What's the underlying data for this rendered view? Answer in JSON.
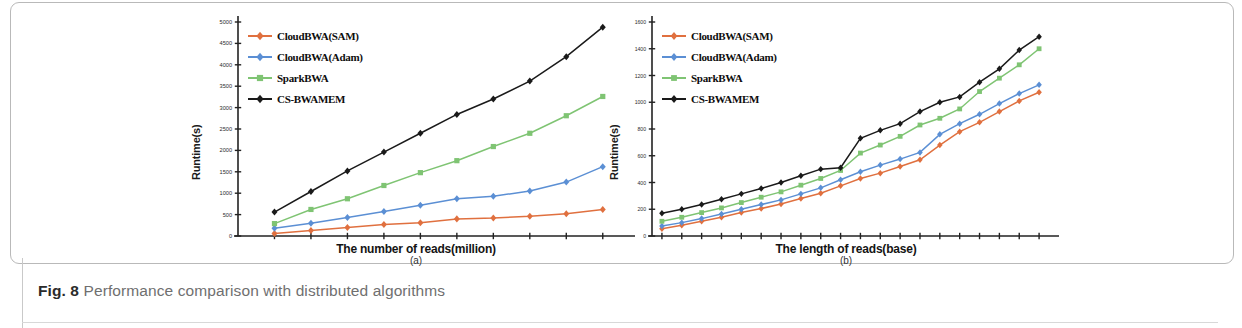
{
  "figure": {
    "number_label": "Fig. 8",
    "caption": "Performance comparison with distributed algorithms"
  },
  "colors": {
    "cloudbwa_sam": "#e0703f",
    "cloudbwa_adam": "#5b8fd4",
    "sparkbwa": "#7fc473",
    "cs_bwamem": "#1a1a1a",
    "axis": "#222222",
    "frame_border": "#b9b9b9",
    "caption_text": "#6f6f6f"
  },
  "legend": {
    "entries": [
      {
        "label": "CloudBWA(SAM)",
        "color_key": "cloudbwa_sam",
        "marker": "diamond"
      },
      {
        "label": "CloudBWA(Adam)",
        "color_key": "cloudbwa_adam",
        "marker": "diamond"
      },
      {
        "label": "SparkBWA",
        "color_key": "sparkbwa",
        "marker": "square"
      },
      {
        "label": "CS-BWAMEM",
        "color_key": "cs_bwamem",
        "marker": "diamond"
      }
    ]
  },
  "chart_data": [
    {
      "id": "panel-a",
      "type": "line",
      "subfigure_label": "(a)",
      "title": "",
      "xlabel": "The number of reads(million)",
      "ylabel": "Runtime(s)",
      "x": [
        4,
        8,
        12,
        16,
        20,
        24,
        28,
        32,
        36,
        40
      ],
      "xticklabels": [
        "4",
        "8",
        "12",
        "16",
        "20",
        "24",
        "28",
        "32",
        "36",
        "40"
      ],
      "xlim": [
        0,
        42
      ],
      "ylim": [
        0,
        5000
      ],
      "yticks": [
        0,
        500,
        1000,
        1500,
        2000,
        2500,
        3000,
        3500,
        4000,
        4500,
        5000
      ],
      "yticklabels": [
        "0",
        "500",
        "1000",
        "1500",
        "2000",
        "2500",
        "3000",
        "3500",
        "4000",
        "4500",
        "5000"
      ],
      "grid": false,
      "legend_position": "upper-left",
      "series": [
        {
          "name": "CloudBWA(SAM)",
          "color_key": "cloudbwa_sam",
          "values": [
            60,
            130,
            200,
            270,
            310,
            400,
            420,
            460,
            520,
            620
          ]
        },
        {
          "name": "CloudBWA(Adam)",
          "color_key": "cloudbwa_adam",
          "values": [
            180,
            300,
            430,
            570,
            720,
            870,
            930,
            1050,
            1260,
            1620
          ]
        },
        {
          "name": "SparkBWA",
          "color_key": "sparkbwa",
          "values": [
            290,
            620,
            870,
            1180,
            1480,
            1760,
            2090,
            2400,
            2810,
            3260
          ]
        },
        {
          "name": "CS-BWAMEM",
          "color_key": "cs_bwamem",
          "values": [
            560,
            1040,
            1520,
            1960,
            2400,
            2840,
            3200,
            3620,
            4190,
            4880
          ]
        }
      ]
    },
    {
      "id": "panel-b",
      "type": "line",
      "subfigure_label": "(b)",
      "title": "",
      "xlabel": "The length of reads(base)",
      "ylabel": "Runtime(s)",
      "x": [
        50,
        100,
        150,
        200,
        250,
        300,
        350,
        400,
        450,
        500,
        550,
        600,
        650,
        700,
        750,
        800,
        850,
        900,
        950,
        1000
      ],
      "xticklabels": [
        "50",
        "100",
        "150",
        "200",
        "250",
        "300",
        "350",
        "400",
        "450",
        "500",
        "550",
        "600",
        "650",
        "700",
        "750",
        "800",
        "850",
        "900",
        "950",
        "1000"
      ],
      "xlim": [
        25,
        1030
      ],
      "ylim": [
        0,
        1600
      ],
      "yticks": [
        0,
        200,
        400,
        600,
        800,
        1000,
        1200,
        1400,
        1600
      ],
      "yticklabels": [
        "0",
        "200",
        "400",
        "600",
        "800",
        "1000",
        "1200",
        "1400",
        "1600"
      ],
      "grid": false,
      "legend_position": "upper-left",
      "series": [
        {
          "name": "CloudBWA(SAM)",
          "color_key": "cloudbwa_sam",
          "values": [
            55,
            80,
            110,
            140,
            175,
            205,
            240,
            280,
            320,
            375,
            430,
            470,
            520,
            570,
            680,
            780,
            850,
            930,
            1010,
            1075
          ]
        },
        {
          "name": "CloudBWA(Adam)",
          "color_key": "cloudbwa_adam",
          "values": [
            75,
            100,
            130,
            165,
            200,
            235,
            270,
            315,
            360,
            420,
            480,
            530,
            575,
            625,
            760,
            840,
            910,
            990,
            1065,
            1130
          ]
        },
        {
          "name": "SparkBWA",
          "color_key": "sparkbwa",
          "values": [
            110,
            140,
            175,
            210,
            250,
            290,
            330,
            380,
            430,
            490,
            620,
            680,
            745,
            830,
            880,
            950,
            1080,
            1180,
            1280,
            1400
          ]
        },
        {
          "name": "CS-BWAMEM",
          "color_key": "cs_bwamem",
          "values": [
            170,
            200,
            235,
            275,
            315,
            355,
            400,
            450,
            500,
            510,
            730,
            790,
            840,
            930,
            1000,
            1040,
            1150,
            1250,
            1390,
            1490
          ]
        }
      ]
    }
  ]
}
